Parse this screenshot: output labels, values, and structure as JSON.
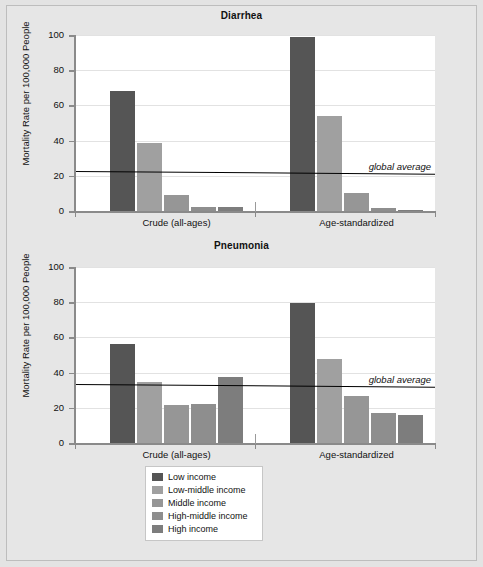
{
  "figure": {
    "background_color": "#e6e6e6",
    "border_color": "#bdbdbd"
  },
  "axis": {
    "ylabel": "Mortality Rate per 100,000 People",
    "yticks": [
      0,
      20,
      40,
      60,
      80,
      100
    ],
    "ylim": [
      0,
      100
    ],
    "group_labels": [
      "Crude (all-ages)",
      "Age-standardized"
    ]
  },
  "legend": {
    "position": "bottom-center",
    "entries": [
      {
        "label": "Low income",
        "color": "#555555"
      },
      {
        "label": "Low-middle income",
        "color": "#a0a0a0"
      },
      {
        "label": "Middle income",
        "color": "#969696"
      },
      {
        "label": "High-middle income",
        "color": "#8e8e8e"
      },
      {
        "label": "High income",
        "color": "#7d7d7d"
      }
    ]
  },
  "annotations": {
    "global_average_label": "global average"
  },
  "chart_data": [
    {
      "type": "bar",
      "title": "Diarrhea",
      "xlabel": "",
      "ylabel": "Mortality Rate per 100,000 People",
      "ylim": [
        0,
        100
      ],
      "yticks": [
        0,
        20,
        40,
        60,
        80,
        100
      ],
      "grid": true,
      "categories": [
        "Crude (all-ages)",
        "Age-standardized"
      ],
      "series": [
        {
          "name": "Low income",
          "color": "#555555",
          "values": [
            68.0,
            99.0
          ]
        },
        {
          "name": "Low-middle income",
          "color": "#a0a0a0",
          "values": [
            38.5,
            54.0
          ]
        },
        {
          "name": "Middle income",
          "color": "#969696",
          "values": [
            9.0,
            10.0
          ]
        },
        {
          "name": "High-middle income",
          "color": "#8e8e8e",
          "values": [
            2.0,
            1.5
          ]
        },
        {
          "name": "High income",
          "color": "#7d7d7d",
          "values": [
            2.5,
            0.8
          ]
        }
      ],
      "reference_line": {
        "label": "global average",
        "value_left": 22.5,
        "value_right": 21.0
      }
    },
    {
      "type": "bar",
      "title": "Pneumonia",
      "xlabel": "",
      "ylabel": "Mortality Rate per 100,000 People",
      "ylim": [
        0,
        100
      ],
      "yticks": [
        0,
        20,
        40,
        60,
        80,
        100
      ],
      "grid": true,
      "categories": [
        "Crude (all-ages)",
        "Age-standardized"
      ],
      "series": [
        {
          "name": "Low income",
          "color": "#555555",
          "values": [
            56.0,
            79.5
          ]
        },
        {
          "name": "Low-middle income",
          "color": "#a0a0a0",
          "values": [
            34.5,
            48.0
          ]
        },
        {
          "name": "Middle income",
          "color": "#969696",
          "values": [
            21.5,
            26.5
          ]
        },
        {
          "name": "High-middle income",
          "color": "#8e8e8e",
          "values": [
            22.0,
            17.0
          ]
        },
        {
          "name": "High income",
          "color": "#7d7d7d",
          "values": [
            37.5,
            16.0
          ]
        }
      ],
      "reference_line": {
        "label": "global average",
        "value_left": 33.5,
        "value_right": 32.0
      }
    }
  ]
}
